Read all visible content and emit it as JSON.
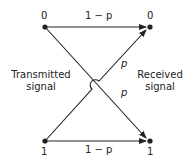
{
  "nodes": {
    "tx0": "0",
    "rx0": "0",
    "tx1": "1",
    "rx1": "1"
  },
  "edges": {
    "top": "1 − p",
    "bottom": "1 − p",
    "cross_up": "p",
    "cross_down": "p"
  },
  "labels": {
    "left": "Transmitted\nsignal",
    "right": "Received\nsignal",
    "left1": "Transmitted",
    "left2": "signal",
    "right1": "Received",
    "right2": "signal"
  }
}
